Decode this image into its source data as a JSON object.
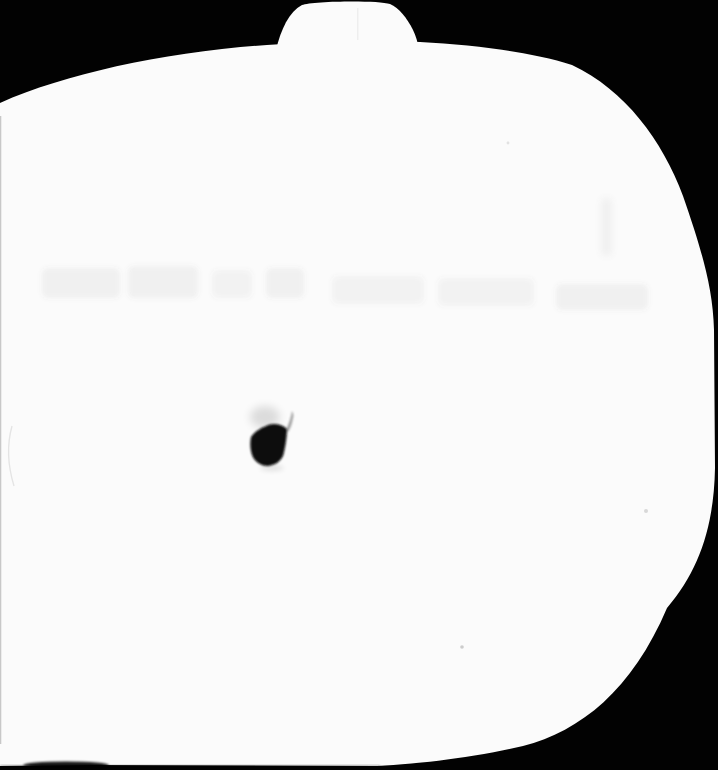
{
  "scene": {
    "kind": "overexposed scanned book page photograph",
    "subject": "white pumpkin-shaped silhouette with stem on black background",
    "ghost_text_note": "one faded illegible line of print across upper third",
    "ink_blob_note": "small dark ink remnant left of center",
    "bottom_smudge_note": "dark smudge streak along bottom-left edge"
  },
  "colors": {
    "background": "#020202",
    "page": "#fbfbfb",
    "ink": "#0a0a0a",
    "ghost": "#666666"
  }
}
